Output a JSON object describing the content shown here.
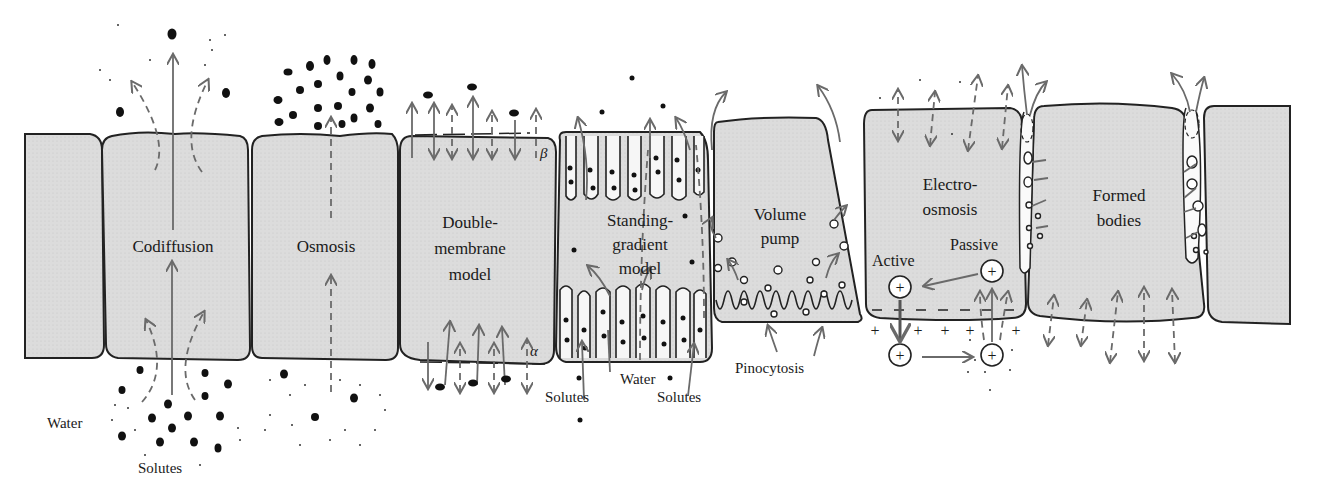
{
  "diagram": {
    "panels": [
      {
        "id": "codiffusion",
        "label": "Codiffusion"
      },
      {
        "id": "osmosis",
        "label": "Osmosis"
      },
      {
        "id": "double-membrane",
        "label_lines": [
          "Double-",
          "membrane",
          "model"
        ],
        "markers": {
          "top": "β",
          "bottom": "α"
        }
      },
      {
        "id": "standing-gradient",
        "label_lines": [
          "Standing-",
          "gradient",
          "model"
        ]
      },
      {
        "id": "volume-pump",
        "label_lines": [
          "Volume",
          "pump"
        ]
      },
      {
        "id": "electro-osmosis",
        "label_lines": [
          "Electro-",
          "osmosis"
        ],
        "sub_labels": {
          "active": "Active",
          "passive": "Passive"
        },
        "ion_symbol": "+",
        "charge_minus": "−",
        "charge_plus": "+"
      },
      {
        "id": "formed-bodies",
        "label_lines": [
          "Formed",
          "bodies"
        ]
      }
    ],
    "annotations": {
      "water": "Water",
      "solutes": "Solutes",
      "sg_water": "Water",
      "sg_solutes_left": "Solutes",
      "sg_solutes_right": "Solutes",
      "pinocytosis": "Pinocytosis"
    }
  }
}
